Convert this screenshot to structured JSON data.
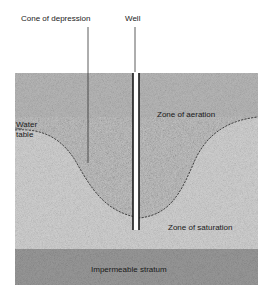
{
  "diagram": {
    "labels": {
      "cone_of_depression": "Cone of depression",
      "well": "Well",
      "water_table_line1": "Water",
      "water_table_line2": "table",
      "zone_of_aeration": "Zone of aeration",
      "zone_of_saturation": "Zone of saturation",
      "impermeable_stratum": "Impermeable stratum"
    },
    "colors": {
      "background": "#ffffff",
      "aeration_zone": "#b9b9b9",
      "saturation_zone": "#d0d0d0",
      "impermeable_stratum": "#9a9a9a",
      "well_pipe": "#1a1a1a",
      "water_table_line": "#333333"
    }
  }
}
